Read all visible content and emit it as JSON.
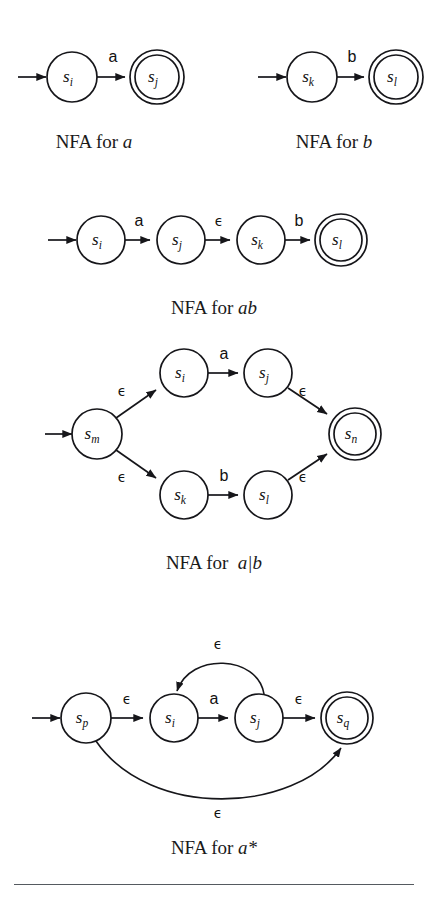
{
  "figure": {
    "kind": "thompson-construction-nfa-diagrams",
    "rows": [
      {
        "id": "row-atomic",
        "diagrams": [
          {
            "id": "nfa-a",
            "caption_prefix": "NFA for ",
            "caption_regex": "a",
            "states": [
              {
                "name": "s",
                "sub": "i",
                "accepting": false,
                "start": true
              },
              {
                "name": "s",
                "sub": "j",
                "accepting": true,
                "start": false
              }
            ],
            "transitions": [
              {
                "from": "s_i",
                "to": "s_j",
                "label": "a"
              }
            ]
          },
          {
            "id": "nfa-b",
            "caption_prefix": "NFA for ",
            "caption_regex": "b",
            "states": [
              {
                "name": "s",
                "sub": "k",
                "accepting": false,
                "start": true
              },
              {
                "name": "s",
                "sub": "l",
                "accepting": true,
                "start": false
              }
            ],
            "transitions": [
              {
                "from": "s_k",
                "to": "s_l",
                "label": "b"
              }
            ]
          }
        ]
      },
      {
        "id": "row-concat",
        "diagrams": [
          {
            "id": "nfa-ab",
            "caption_prefix": "NFA for ",
            "caption_regex": "ab",
            "states": [
              {
                "name": "s",
                "sub": "i",
                "accepting": false,
                "start": true
              },
              {
                "name": "s",
                "sub": "j",
                "accepting": false,
                "start": false
              },
              {
                "name": "s",
                "sub": "k",
                "accepting": false,
                "start": false
              },
              {
                "name": "s",
                "sub": "l",
                "accepting": true,
                "start": false
              }
            ],
            "transitions": [
              {
                "from": "s_i",
                "to": "s_j",
                "label": "a"
              },
              {
                "from": "s_j",
                "to": "s_k",
                "label": "ϵ"
              },
              {
                "from": "s_k",
                "to": "s_l",
                "label": "b"
              }
            ]
          }
        ]
      },
      {
        "id": "row-alternation",
        "diagrams": [
          {
            "id": "nfa-a-or-b",
            "caption_prefix": "NFA for ",
            "caption_regex": "a|b",
            "states": [
              {
                "name": "s",
                "sub": "m",
                "accepting": false,
                "start": true
              },
              {
                "name": "s",
                "sub": "i",
                "accepting": false,
                "start": false
              },
              {
                "name": "s",
                "sub": "j",
                "accepting": false,
                "start": false
              },
              {
                "name": "s",
                "sub": "k",
                "accepting": false,
                "start": false
              },
              {
                "name": "s",
                "sub": "l",
                "accepting": false,
                "start": false
              },
              {
                "name": "s",
                "sub": "n",
                "accepting": true,
                "start": false
              }
            ],
            "transitions": [
              {
                "from": "s_m",
                "to": "s_i",
                "label": "ϵ"
              },
              {
                "from": "s_i",
                "to": "s_j",
                "label": "a"
              },
              {
                "from": "s_j",
                "to": "s_n",
                "label": "ϵ"
              },
              {
                "from": "s_m",
                "to": "s_k",
                "label": "ϵ"
              },
              {
                "from": "s_k",
                "to": "s_l",
                "label": "b"
              },
              {
                "from": "s_l",
                "to": "s_n",
                "label": "ϵ"
              }
            ]
          }
        ]
      },
      {
        "id": "row-star",
        "diagrams": [
          {
            "id": "nfa-a-star",
            "caption_prefix": "NFA for ",
            "caption_regex": "a*",
            "states": [
              {
                "name": "s",
                "sub": "p",
                "accepting": false,
                "start": true
              },
              {
                "name": "s",
                "sub": "i",
                "accepting": false,
                "start": false
              },
              {
                "name": "s",
                "sub": "j",
                "accepting": false,
                "start": false
              },
              {
                "name": "s",
                "sub": "q",
                "accepting": true,
                "start": false
              }
            ],
            "transitions": [
              {
                "from": "s_p",
                "to": "s_i",
                "label": "ϵ"
              },
              {
                "from": "s_i",
                "to": "s_j",
                "label": "a"
              },
              {
                "from": "s_j",
                "to": "s_q",
                "label": "ϵ"
              },
              {
                "from": "s_j",
                "to": "s_i",
                "label": "ϵ"
              },
              {
                "from": "s_p",
                "to": "s_q",
                "label": "ϵ"
              }
            ]
          }
        ]
      }
    ],
    "labels": {
      "a": "a",
      "b": "b",
      "epsilon": "ϵ",
      "state_s": "s",
      "sub_i": "i",
      "sub_j": "j",
      "sub_k": "k",
      "sub_l": "l",
      "sub_m": "m",
      "sub_n": "n",
      "sub_p": "p",
      "sub_q": "q"
    },
    "captions": {
      "nfa_for": "NFA for ",
      "regex_a": "a",
      "regex_b": "b",
      "regex_ab": "ab",
      "regex_a_or_b": "a|b",
      "regex_a_star": "a*"
    },
    "colors": {
      "ink": "#16161a",
      "paper": "#ffffff",
      "rule": "#555a60"
    }
  }
}
